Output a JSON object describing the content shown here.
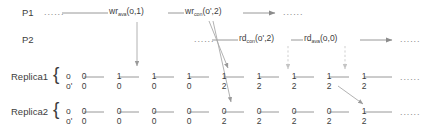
{
  "diagram": {
    "ellipsis": "......",
    "processes": [
      {
        "id": "P1",
        "label": "P1"
      },
      {
        "id": "P2",
        "label": "P2"
      }
    ],
    "operations": [
      {
        "id": "wr-ava",
        "op": "wr",
        "sub": "ava",
        "args": "(o,1)",
        "text": "wr",
        "full": "wr_ava(o,1)"
      },
      {
        "id": "wr-con",
        "op": "wr",
        "sub": "con",
        "args": "(o',2)",
        "text": "wr",
        "full": "wr_con(o',2)"
      },
      {
        "id": "rd-con",
        "op": "rd",
        "sub": "con",
        "args": "(o',2)",
        "text": "rd",
        "full": "rd_con(o',2)"
      },
      {
        "id": "rd-ava",
        "op": "rd",
        "sub": "ava",
        "args": "(o,0)",
        "text": "rd",
        "full": "rd_ava(o,0)"
      }
    ],
    "replicas": [
      {
        "id": "replica1",
        "label": "Replica1",
        "brace": "{",
        "objects": [
          "o",
          "o'"
        ],
        "values_o": [
          "0",
          "1",
          "1",
          "1",
          "1",
          "1",
          "1",
          "1",
          "1"
        ],
        "values_oprime": [
          "0",
          "0",
          "0",
          "0",
          "2",
          "2",
          "2",
          "2",
          "2"
        ]
      },
      {
        "id": "replica2",
        "label": "Replica2",
        "brace": "{",
        "objects": [
          "o",
          "o'"
        ],
        "values_o": [
          "0",
          "0",
          "0",
          "0",
          "0",
          "0",
          "0",
          "0",
          "1"
        ],
        "values_oprime": [
          "0",
          "0",
          "0",
          "0",
          "2",
          "2",
          "2",
          "2",
          "2"
        ]
      }
    ],
    "colors": {
      "ink": "#3d3d3d",
      "line": "#8c8c8c",
      "dashed": "#c4c4c4",
      "dots": "#8a8a8a"
    }
  }
}
